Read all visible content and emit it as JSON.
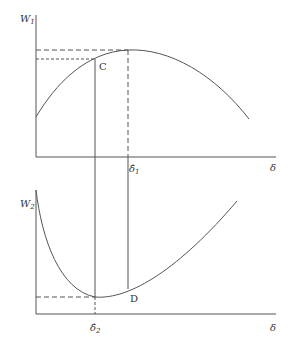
{
  "top_panel": {
    "y_label": "W",
    "y_label_sub": "1",
    "x_label": "δ",
    "tick_label": "δ̂",
    "tick_label_sub": "1",
    "point_label": "C",
    "curve_shape": "concave, rising to a maximum at δ̂1 then falling"
  },
  "bottom_panel": {
    "y_label": "W",
    "y_label_sub": "2",
    "x_label": "δ",
    "tick_label": "δ̂",
    "tick_label_sub": "2",
    "point_label": "D",
    "curve_shape": "convex, falling to a minimum at δ̂2 then rising"
  },
  "colors": {
    "line": "#555555",
    "text": "#333333",
    "background": "#ffffff"
  }
}
